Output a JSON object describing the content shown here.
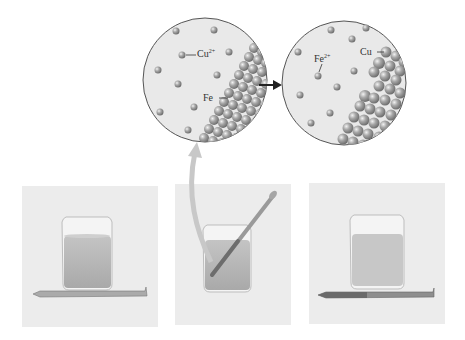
{
  "diagram": {
    "type": "chemistry-reaction-illustration",
    "colors": {
      "background": "#ffffff",
      "circle_fill": "#e9e9e9",
      "circle_stroke": "#555555",
      "atom": "#9a9a9a",
      "photo_bg": "#ececec",
      "solution": "#b9b9b9",
      "arrow": "#222222",
      "curved_arrow": "#c8c8c8"
    },
    "zoom_before": {
      "ion_label": "Cu",
      "ion_charge": "2+",
      "metal_label": "Fe"
    },
    "zoom_after": {
      "ion_label": "Fe",
      "ion_charge": "2+",
      "metal_label": "Cu"
    },
    "panels": [
      {
        "name": "before",
        "caption": ""
      },
      {
        "name": "during",
        "caption": ""
      },
      {
        "name": "after",
        "caption": ""
      }
    ]
  }
}
